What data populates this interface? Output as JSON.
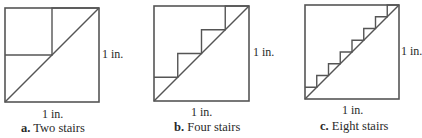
{
  "figures": [
    {
      "id": "a",
      "stairs": 2,
      "caption_letter": "a.",
      "caption_text": "Two stairs",
      "side_label": "1 in.",
      "bottom_label": "1 in.",
      "square": {
        "x": 5,
        "y": 8,
        "size": 94
      }
    },
    {
      "id": "b",
      "stairs": 4,
      "caption_letter": "b.",
      "caption_text": "Four stairs",
      "side_label": "1 in.",
      "bottom_label": "1 in.",
      "square": {
        "x": 154,
        "y": 6,
        "size": 95
      }
    },
    {
      "id": "c",
      "stairs": 8,
      "caption_letter": "c.",
      "caption_text": "Eight stairs",
      "side_label": "1 in.",
      "bottom_label": "1 in.",
      "square": {
        "x": 305,
        "y": 5,
        "size": 94
      }
    }
  ],
  "colors": {
    "stroke": "#555555",
    "text": "#2a2a2a"
  }
}
